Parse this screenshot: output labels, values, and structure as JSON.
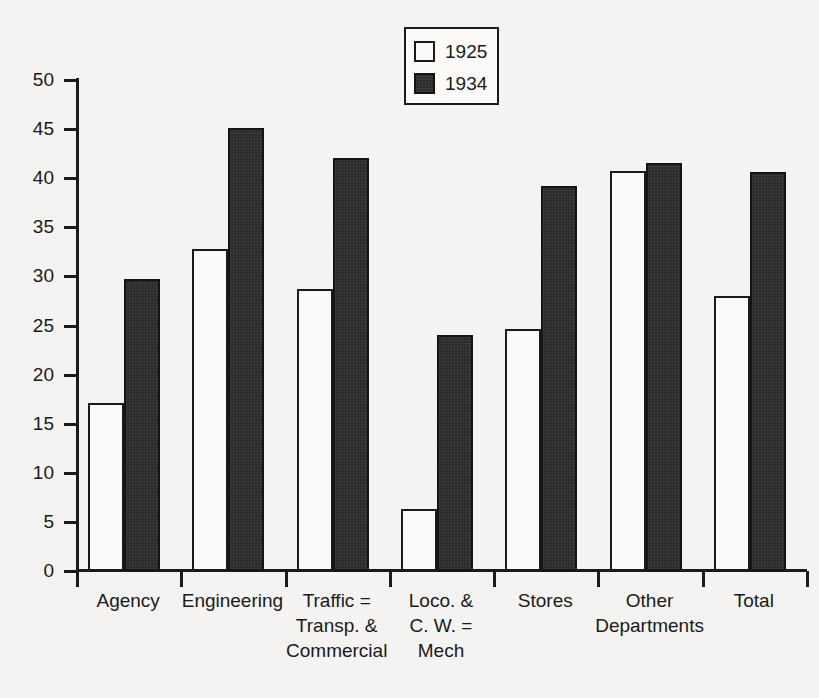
{
  "chart_data": {
    "type": "bar",
    "title": "",
    "xlabel": "",
    "ylabel": "",
    "ylim": [
      0,
      50
    ],
    "ytick_step": 5,
    "yticks": [
      0,
      5,
      10,
      15,
      20,
      25,
      30,
      35,
      40,
      45,
      50
    ],
    "grid": false,
    "legend_position": "top-center",
    "categories": [
      "Agency",
      "Engineering",
      "Traffic =\nTransp. &\nCommercial",
      "Loco. &\nC. W. =\nMech",
      "Stores",
      "Other\nDepartments",
      "Total"
    ],
    "series": [
      {
        "name": "1925",
        "color": "#fbfaf8",
        "values": [
          17.1,
          32.8,
          28.7,
          6.3,
          24.6,
          40.7,
          28.0
        ]
      },
      {
        "name": "1934",
        "color": "#2b2b2b",
        "values": [
          29.7,
          45.1,
          42.1,
          24.0,
          39.2,
          41.5,
          40.6
        ]
      }
    ]
  },
  "legend": {
    "entries": [
      {
        "label": "1925",
        "swatch": "hollow-square-swatch"
      },
      {
        "label": "1934",
        "swatch": "filled-square-swatch"
      }
    ]
  },
  "colors": {
    "ink": "#1a1a1a",
    "paper": "#f4f3f1",
    "bar_light": "#fbfaf8",
    "bar_dark": "#2b2b2b"
  }
}
